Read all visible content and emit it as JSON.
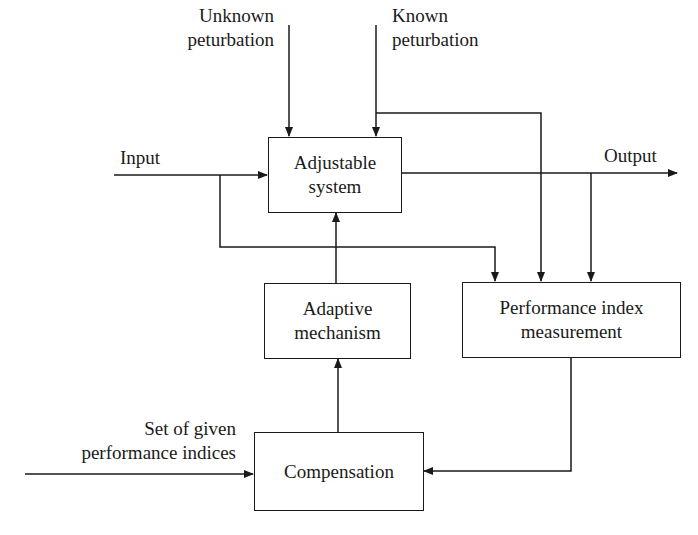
{
  "diagram": {
    "type": "block-diagram",
    "blocks": {
      "adjustable_system": {
        "line1": "Adjustable",
        "line2": "system"
      },
      "adaptive_mechanism": {
        "line1": "Adaptive",
        "line2": "mechanism"
      },
      "performance_index": {
        "line1": "Performance index",
        "line2": "measurement"
      },
      "compensation": {
        "line1": "Compensation"
      }
    },
    "signals": {
      "unknown_perturbation": {
        "line1": "Unknown",
        "line2": "peturbation"
      },
      "known_perturbation": {
        "line1": "Known",
        "line2": "peturbation"
      },
      "input": "Input",
      "output": "Output",
      "performance_indices": {
        "line1": "Set of given",
        "line2": "performance indices"
      }
    },
    "connections": [
      {
        "from": "unknown_perturbation",
        "to": "adjustable_system"
      },
      {
        "from": "known_perturbation",
        "to": "adjustable_system"
      },
      {
        "from": "known_perturbation",
        "to": "performance_index"
      },
      {
        "from": "input",
        "to": "adjustable_system"
      },
      {
        "from": "input",
        "to": "performance_index"
      },
      {
        "from": "adjustable_system",
        "to": "output"
      },
      {
        "from": "output",
        "to": "performance_index"
      },
      {
        "from": "performance_index",
        "to": "compensation"
      },
      {
        "from": "performance_indices",
        "to": "compensation"
      },
      {
        "from": "compensation",
        "to": "adaptive_mechanism"
      },
      {
        "from": "adaptive_mechanism",
        "to": "adjustable_system"
      }
    ],
    "colors": {
      "stroke": "#1a1a1a",
      "background": "#ffffff"
    }
  }
}
